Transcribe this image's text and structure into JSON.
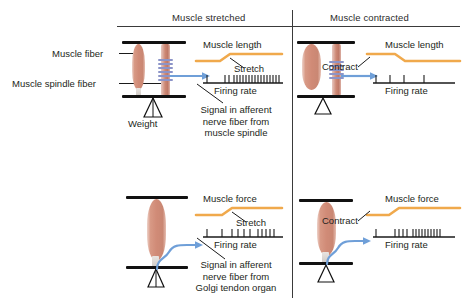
{
  "figure": {
    "columns": [
      {
        "id": "stretched",
        "title": "Muscle stretched"
      },
      {
        "id": "contracted",
        "title": "Muscle contracted"
      }
    ],
    "left_labels": [
      {
        "id": "muscle-fiber",
        "text": "Muscle fiber"
      },
      {
        "id": "muscle-spindle-fiber",
        "text": "Muscle spindle fiber"
      }
    ],
    "weight_label": "Weight",
    "callouts": [
      {
        "id": "spindle-callout",
        "lines": [
          "Signal in afferent",
          "nerve fiber from",
          "muscle spindle"
        ]
      },
      {
        "id": "golgi-callout",
        "lines": [
          "Signal in afferent",
          "nerve fiber from",
          "Golgi tendon organ"
        ]
      }
    ],
    "panels": [
      {
        "id": "spindle-stretched",
        "receptor": "muscle spindle",
        "condition": "stretched",
        "trace_title": "Muscle length",
        "event_label": "Stretch",
        "firing_label": "Firing rate"
      },
      {
        "id": "spindle-contracted",
        "receptor": "muscle spindle",
        "condition": "contracted",
        "trace_title": "Muscle length",
        "event_label": "Contract",
        "firing_label": "Firing rate"
      },
      {
        "id": "golgi-stretched",
        "receptor": "Golgi tendon organ",
        "condition": "stretched",
        "trace_title": "Muscle force",
        "event_label": "Stretch",
        "firing_label": "Firing rate"
      },
      {
        "id": "golgi-contracted",
        "receptor": "Golgi tendon organ",
        "condition": "contracted",
        "trace_title": "Muscle force",
        "event_label": "Contract",
        "firing_label": "Firing rate"
      }
    ],
    "colors": {
      "trace": "#f0a94c",
      "nerve": "#6f9fd8",
      "spindle": "#8c94c8",
      "muscle": "#d89a86",
      "ink": "#231f20",
      "rule": "#3a3a3a"
    }
  }
}
